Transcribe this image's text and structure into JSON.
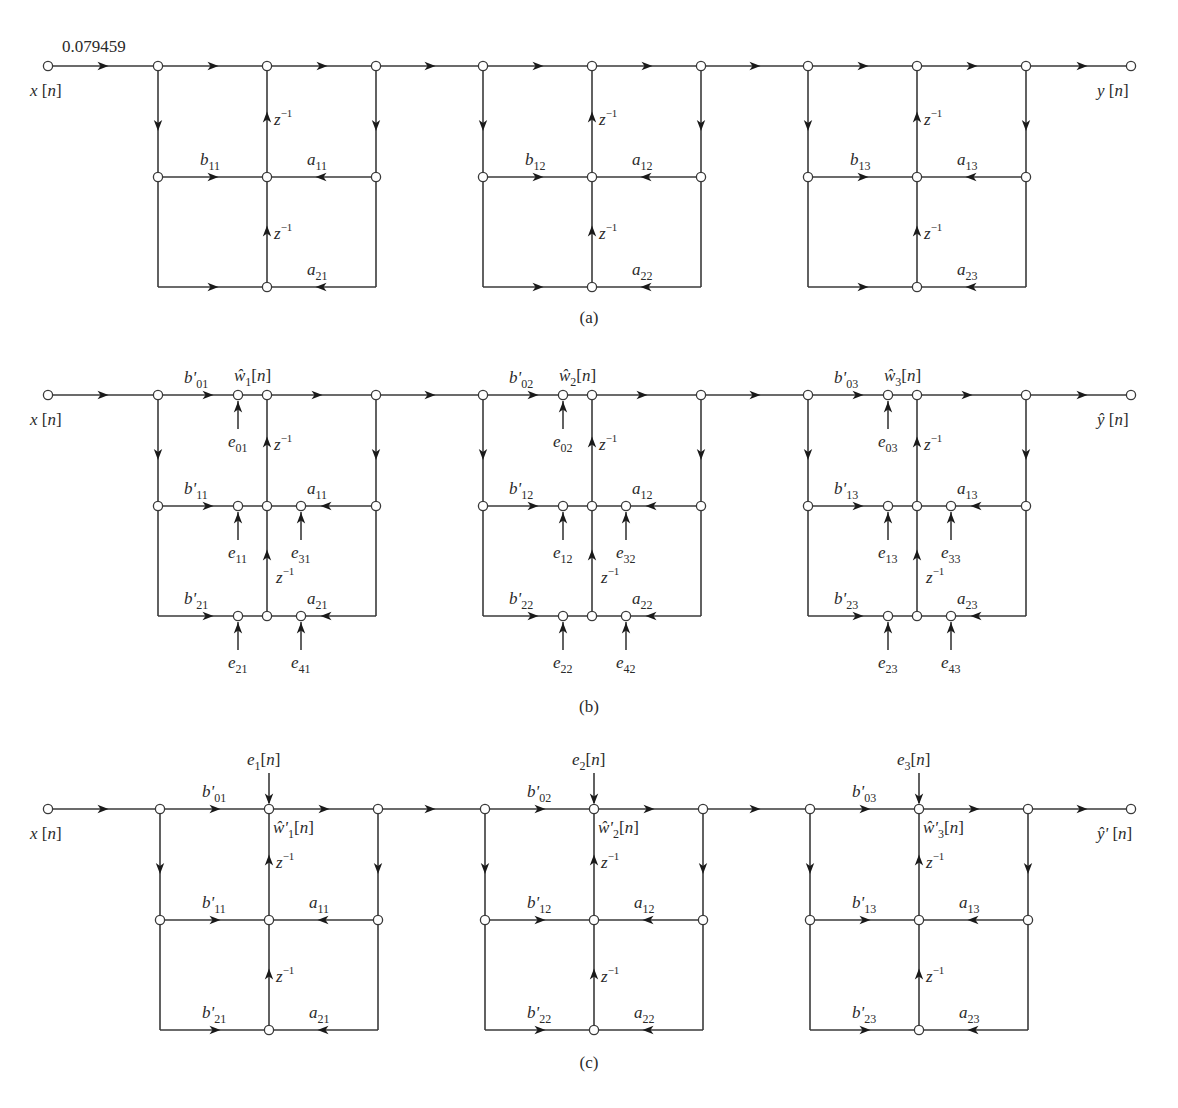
{
  "figure": {
    "panels": [
      {
        "id": "a",
        "caption": "(a)",
        "input_label": "x[n]",
        "output_label": "y[n]",
        "input_gain": "0.079459",
        "y": {
          "top": 66,
          "mid": 177,
          "bot": 287
        },
        "caption_y": 323,
        "has_error_sources": false,
        "sections": [
          {
            "x": [
              158,
              267,
              376
            ],
            "b_top": "",
            "b_mid": "b",
            "b_mid_sub": "11",
            "b_bot": "",
            "a_mid": "a",
            "a_mid_sub": "11",
            "a_bot": "a",
            "a_bot_sub": "21",
            "delay": "z",
            "delay_sup": "−1"
          },
          {
            "x": [
              483,
              592,
              701
            ],
            "b_top": "",
            "b_mid": "b",
            "b_mid_sub": "12",
            "b_bot": "",
            "a_mid": "a",
            "a_mid_sub": "12",
            "a_bot": "a",
            "a_bot_sub": "22",
            "delay": "z",
            "delay_sup": "−1"
          },
          {
            "x": [
              808,
              917,
              1026
            ],
            "b_top": "",
            "b_mid": "b",
            "b_mid_sub": "13",
            "b_bot": "",
            "a_mid": "a",
            "a_mid_sub": "13",
            "a_bot": "a",
            "a_bot_sub": "23",
            "delay": "z",
            "delay_sup": "−1"
          }
        ]
      },
      {
        "id": "b",
        "caption": "(b)",
        "input_label": "x[n]",
        "output_label": "ŷ[n]",
        "input_gain": "",
        "y": {
          "top": 395,
          "mid": 506,
          "bot": 616
        },
        "caption_y": 712,
        "has_error_sources": true,
        "sections": [
          {
            "x": [
              158,
              267,
              376
            ],
            "w_label": "ŵ",
            "w_sub": "1",
            "w_arg": "[n]",
            "b_top": "b'",
            "b_top_sub": "01",
            "b_mid": "b'",
            "b_mid_sub": "11",
            "b_bot": "b'",
            "b_bot_sub": "21",
            "a_mid": "a",
            "a_mid_sub": "11",
            "a_bot": "a",
            "a_bot_sub": "21",
            "delay": "z",
            "delay_sup": "−1",
            "errors": {
              "e_top": "01",
              "e_mid_left": "11",
              "e_mid_right": "31",
              "e_bot_left": "21",
              "e_bot_right": "41"
            }
          },
          {
            "x": [
              483,
              592,
              701
            ],
            "w_label": "ŵ",
            "w_sub": "2",
            "w_arg": "[n]",
            "b_top": "b'",
            "b_top_sub": "02",
            "b_mid": "b'",
            "b_mid_sub": "12",
            "b_bot": "b'",
            "b_bot_sub": "22",
            "a_mid": "a",
            "a_mid_sub": "12",
            "a_bot": "a",
            "a_bot_sub": "22",
            "delay": "z",
            "delay_sup": "−1",
            "errors": {
              "e_top": "02",
              "e_mid_left": "12",
              "e_mid_right": "32",
              "e_bot_left": "22",
              "e_bot_right": "42"
            }
          },
          {
            "x": [
              808,
              917,
              1026
            ],
            "w_label": "ŵ",
            "w_sub": "3",
            "w_arg": "[n]",
            "b_top": "b'",
            "b_top_sub": "03",
            "b_mid": "b'",
            "b_mid_sub": "13",
            "b_bot": "b'",
            "b_bot_sub": "23",
            "a_mid": "a",
            "a_mid_sub": "13",
            "a_bot": "a",
            "a_bot_sub": "23",
            "delay": "z",
            "delay_sup": "−1",
            "errors": {
              "e_top": "03",
              "e_mid_left": "13",
              "e_mid_right": "33",
              "e_bot_left": "23",
              "e_bot_right": "43"
            }
          }
        ]
      },
      {
        "id": "c",
        "caption": "(c)",
        "input_label": "x[n]",
        "output_label": "ŷ'[n]",
        "input_gain": "",
        "y": {
          "top": 809,
          "mid": 920,
          "bot": 1030
        },
        "caption_y": 1068,
        "has_error_sources": false,
        "combined_error": true,
        "sections": [
          {
            "x": [
              160,
              269,
              378
            ],
            "w_label": "ŵ'",
            "w_sub": "1",
            "w_arg": "[n]",
            "e_in": "e",
            "e_in_sub": "1",
            "e_in_arg": "[n]",
            "b_top": "b'",
            "b_top_sub": "01",
            "b_mid": "b'",
            "b_mid_sub": "11",
            "b_bot": "b'",
            "b_bot_sub": "21",
            "a_mid": "a",
            "a_mid_sub": "11",
            "a_bot": "a",
            "a_bot_sub": "21",
            "delay": "z",
            "delay_sup": "−1"
          },
          {
            "x": [
              485,
              594,
              703
            ],
            "w_label": "ŵ'",
            "w_sub": "2",
            "w_arg": "[n]",
            "e_in": "e",
            "e_in_sub": "2",
            "e_in_arg": "[n]",
            "b_top": "b'",
            "b_top_sub": "02",
            "b_mid": "b'",
            "b_mid_sub": "12",
            "b_bot": "b'",
            "b_bot_sub": "22",
            "a_mid": "a",
            "a_mid_sub": "12",
            "a_bot": "a",
            "a_bot_sub": "22",
            "delay": "z",
            "delay_sup": "−1"
          },
          {
            "x": [
              810,
              919,
              1028
            ],
            "w_label": "ŵ'",
            "w_sub": "3",
            "w_arg": "[n]",
            "e_in": "e",
            "e_in_sub": "3",
            "e_in_arg": "[n]",
            "b_top": "b'",
            "b_top_sub": "03",
            "b_mid": "b'",
            "b_mid_sub": "13",
            "b_bot": "b'",
            "b_bot_sub": "23",
            "a_mid": "a",
            "a_mid_sub": "13",
            "a_bot": "a",
            "a_bot_sub": "23",
            "delay": "z",
            "delay_sup": "−1"
          }
        ]
      }
    ],
    "colors": {
      "line": "#3a3a3a",
      "arrow": "#1a1a1a",
      "text": "#2a2a2a",
      "background": "#ffffff"
    }
  }
}
